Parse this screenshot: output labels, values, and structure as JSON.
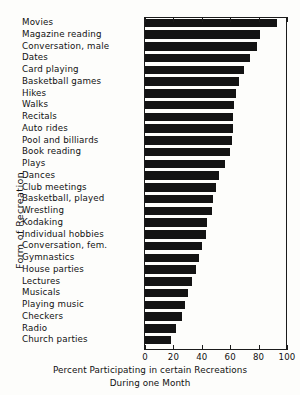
{
  "chart_data": {
    "type": "bar",
    "orientation": "horizontal",
    "title": "",
    "xlabel": "Percent Participating in certain Recreations During one Month",
    "ylabel": "Form of Recreation",
    "xlim": [
      0,
      100
    ],
    "xticks": [
      0,
      20,
      40,
      60,
      80,
      100
    ],
    "grid": false,
    "legend": null,
    "categories": [
      "Movies",
      "Magazine reading",
      "Conversation, male",
      "Dates",
      "Card playing",
      "Basketball games",
      "Hikes",
      "Walks",
      "Recitals",
      "Auto rides",
      "Pool and billiards",
      "Book reading",
      "Plays",
      "Dances",
      "Club meetings",
      "Basketball, played",
      "Wrestling",
      "Kodaking",
      "Individual hobbies",
      "Conversation, fem.",
      "Gymnastics",
      "House parties",
      "Lectures",
      "Musicals",
      "Playing music",
      "Checkers",
      "Radio",
      "Church parties"
    ],
    "values": [
      93,
      81,
      79,
      74,
      70,
      66,
      64,
      63,
      62,
      62,
      61,
      60,
      56,
      52,
      50,
      48,
      47,
      44,
      43,
      40,
      38,
      36,
      33,
      30,
      28,
      26,
      22,
      18
    ],
    "bar_color": "#131313"
  },
  "caption": {
    "line1": "Percent Participating in certain Recreations",
    "line2": "During one Month"
  },
  "axis": {
    "y_title": "Form of Recreation"
  }
}
